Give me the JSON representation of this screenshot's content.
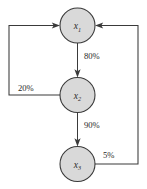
{
  "diagram": {
    "type": "state-transition-flow",
    "nodes": [
      {
        "id": "x1",
        "label": "x",
        "subscript": "1",
        "cx": 77.5,
        "cy": 25.5,
        "r": 17.5
      },
      {
        "id": "x2",
        "label": "x",
        "subscript": "2",
        "cx": 77.5,
        "cy": 95.0,
        "r": 17.5
      },
      {
        "id": "x3",
        "label": "x",
        "subscript": "3",
        "cx": 77.5,
        "cy": 164.0,
        "r": 17.5
      }
    ],
    "edges": [
      {
        "id": "e1",
        "from": "x1",
        "to": "x2",
        "label": "80%",
        "label_x": 84,
        "label_y": 59
      },
      {
        "id": "e2",
        "from": "x2",
        "to": "x3",
        "label": "90%",
        "label_x": 84,
        "label_y": 128
      },
      {
        "id": "e3",
        "from": "x2",
        "to": "x1",
        "label": "20%",
        "label_x": 18,
        "label_y": 91
      },
      {
        "id": "e4",
        "from": "x3",
        "to": "x1",
        "label": "5%",
        "label_x": 103,
        "label_y": 158
      }
    ],
    "colors": {
      "node_fill": "#d9d9d9",
      "node_stroke": "#3a3a3a",
      "edge_stroke": "#3a3a3a",
      "label_text": "#1f1f1f",
      "background": "#ffffff"
    }
  }
}
